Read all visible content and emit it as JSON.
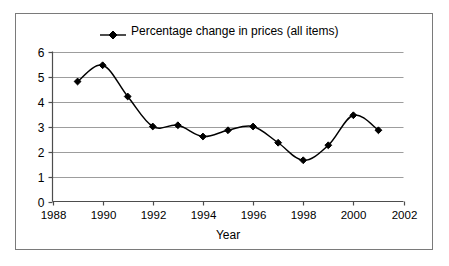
{
  "chart_data": {
    "type": "line",
    "title": "",
    "xlabel": "Year",
    "ylabel": "",
    "legend": [
      "Percentage change in prices (all items)"
    ],
    "legend_position": "top-center",
    "grid": true,
    "grid_axis": "y",
    "marker": "diamond",
    "series_color": "#000000",
    "x": [
      1989,
      1990,
      1991,
      1992,
      1993,
      1994,
      1995,
      1996,
      1997,
      1998,
      1999,
      2000,
      2001
    ],
    "series": [
      {
        "name": "Percentage change in prices (all items)",
        "values": [
          4.8,
          5.45,
          4.2,
          3.0,
          3.05,
          2.6,
          2.85,
          3.0,
          2.35,
          1.65,
          2.25,
          3.45,
          2.85
        ]
      }
    ],
    "xlim": [
      1988,
      2002
    ],
    "ylim": [
      0,
      6
    ],
    "xticks": [
      1988,
      1990,
      1992,
      1994,
      1996,
      1998,
      2000,
      2002
    ],
    "xtick_labels": [
      "1988",
      "1990",
      "1992",
      "1994",
      "1996",
      "1998",
      "2000",
      "2002"
    ],
    "yticks": [
      0,
      1,
      2,
      3,
      4,
      5,
      6
    ],
    "ytick_labels": [
      "0",
      "1",
      "2",
      "3",
      "4",
      "5",
      "6"
    ]
  },
  "legend": {
    "label": "Percentage change in prices (all items)"
  },
  "axes": {
    "x_title": "Year"
  }
}
